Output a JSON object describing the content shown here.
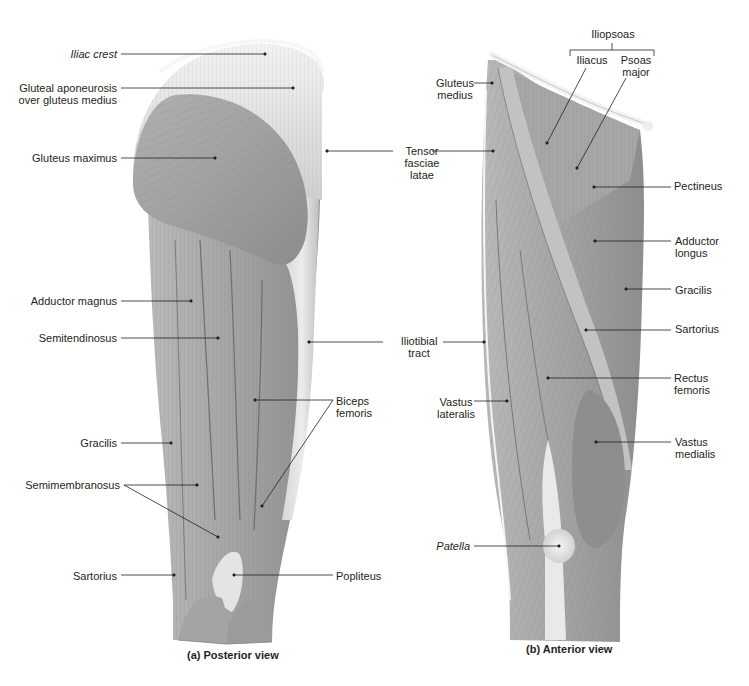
{
  "figure": {
    "panels": [
      {
        "id": "posterior",
        "caption": "(a) Posterior view",
        "labels": [
          {
            "id": "iliac-crest",
            "text": "Iliac crest",
            "italic": true
          },
          {
            "id": "gluteal-aponeurosis",
            "text": "Gluteal aponeurosis\nover gluteus medius"
          },
          {
            "id": "gluteus-maximus",
            "text": "Gluteus maximus"
          },
          {
            "id": "adductor-magnus",
            "text": "Adductor magnus"
          },
          {
            "id": "semitendinosus",
            "text": "Semitendinosus"
          },
          {
            "id": "gracilis-post",
            "text": "Gracilis"
          },
          {
            "id": "semimembranosus",
            "text": "Semimembranosus"
          },
          {
            "id": "sartorius-post",
            "text": "Sartorius"
          },
          {
            "id": "biceps-femoris",
            "text": "Biceps\nfemoris"
          },
          {
            "id": "popliteus",
            "text": "Popliteus"
          }
        ]
      },
      {
        "id": "anterior",
        "caption": "(b) Anterior view",
        "labels": [
          {
            "id": "iliopsoas",
            "text": "Iliopsoas"
          },
          {
            "id": "iliacus",
            "text": "Iliacus"
          },
          {
            "id": "psoas-major",
            "text": "Psoas\nmajor"
          },
          {
            "id": "gluteus-medius",
            "text": "Gluteus\nmedius"
          },
          {
            "id": "pectineus",
            "text": "Pectineus"
          },
          {
            "id": "adductor-longus",
            "text": "Adductor\nlongus"
          },
          {
            "id": "gracilis-ant",
            "text": "Gracilis"
          },
          {
            "id": "sartorius-ant",
            "text": "Sartorius"
          },
          {
            "id": "rectus-femoris",
            "text": "Rectus\nfemoris"
          },
          {
            "id": "vastus-lateralis",
            "text": "Vastus\nlateralis"
          },
          {
            "id": "vastus-medialis",
            "text": "Vastus\nmedialis"
          },
          {
            "id": "patella",
            "text": "Patella",
            "italic": true
          }
        ]
      }
    ],
    "shared_labels": [
      {
        "id": "tensor-fasciae-latae",
        "text": "Tensor\nfasciae\nlatae"
      },
      {
        "id": "iliotibial-tract",
        "text": "Iliotibial\ntract"
      }
    ],
    "colors": {
      "muscle": "#9a9a9a",
      "muscle_dark": "#7d7d7d",
      "muscle_light": "#bdbdbd",
      "tendon": "#e6e6e6",
      "leader_line": "#231f20",
      "text": "#231f20"
    }
  }
}
